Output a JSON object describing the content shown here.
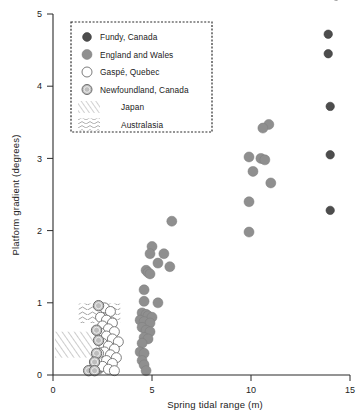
{
  "chart_data": {
    "type": "scatter",
    "title": "",
    "xlabel": "Spring tidal range (m)",
    "ylabel": "Platform gradient (degrees)",
    "xlim": [
      0,
      15
    ],
    "ylim": [
      0,
      5
    ],
    "xticks": [
      0,
      5,
      10,
      15
    ],
    "yticks": [
      0,
      1,
      2,
      3,
      4,
      5
    ],
    "xtick_labels": [
      "0",
      "5",
      "10",
      "15"
    ],
    "ytick_labels": [
      "0",
      "1",
      "2",
      "3",
      "4",
      "5"
    ],
    "grid": false,
    "legend_position": "top-left",
    "series": [
      {
        "name": "Fundy, Canada",
        "marker": "filled-circle",
        "color": "#4d4d4d",
        "points": [
          [
            14.3,
            5.25
          ],
          [
            13.9,
            4.72
          ],
          [
            13.9,
            4.45
          ],
          [
            14.0,
            3.72
          ],
          [
            14.0,
            3.05
          ],
          [
            14.0,
            2.28
          ]
        ]
      },
      {
        "name": "England and Wales",
        "marker": "grey-circle",
        "color": "#8f8f8f",
        "points": [
          [
            10.9,
            3.47
          ],
          [
            10.6,
            3.42
          ],
          [
            9.9,
            3.02
          ],
          [
            10.5,
            3.0
          ],
          [
            10.7,
            2.98
          ],
          [
            10.1,
            2.82
          ],
          [
            11.0,
            2.66
          ],
          [
            9.9,
            2.4
          ],
          [
            9.9,
            1.98
          ],
          [
            6.0,
            2.13
          ],
          [
            5.6,
            1.68
          ],
          [
            5.9,
            1.5
          ],
          [
            5.0,
            1.78
          ],
          [
            4.9,
            1.68
          ],
          [
            5.3,
            1.55
          ],
          [
            4.7,
            1.45
          ],
          [
            4.8,
            1.42
          ],
          [
            4.9,
            1.4
          ],
          [
            4.6,
            1.18
          ],
          [
            4.6,
            1.02
          ],
          [
            5.3,
            1.0
          ],
          [
            4.5,
            0.86
          ],
          [
            4.7,
            0.84
          ],
          [
            4.8,
            0.82
          ],
          [
            5.0,
            0.8
          ],
          [
            4.4,
            0.76
          ],
          [
            4.6,
            0.74
          ],
          [
            4.9,
            0.72
          ],
          [
            4.5,
            0.66
          ],
          [
            4.7,
            0.62
          ],
          [
            4.9,
            0.6
          ],
          [
            4.6,
            0.52
          ],
          [
            4.8,
            0.5
          ],
          [
            4.5,
            0.44
          ],
          [
            4.4,
            0.32
          ],
          [
            4.6,
            0.3
          ],
          [
            4.5,
            0.2
          ],
          [
            4.6,
            0.14
          ],
          [
            4.7,
            0.06
          ],
          [
            2.0,
            0.08
          ],
          [
            2.3,
            0.08
          ]
        ]
      },
      {
        "name": "Gaspé, Quebec",
        "marker": "open-circle",
        "color": "#ffffff",
        "points": [
          [
            2.6,
            0.93
          ],
          [
            2.9,
            0.88
          ],
          [
            2.4,
            0.8
          ],
          [
            2.7,
            0.76
          ],
          [
            3.0,
            0.72
          ],
          [
            2.5,
            0.68
          ],
          [
            2.8,
            0.64
          ],
          [
            3.1,
            0.6
          ],
          [
            2.4,
            0.58
          ],
          [
            2.7,
            0.54
          ],
          [
            3.0,
            0.5
          ],
          [
            3.3,
            0.46
          ],
          [
            2.5,
            0.44
          ],
          [
            2.8,
            0.4
          ],
          [
            3.1,
            0.36
          ],
          [
            2.6,
            0.32
          ],
          [
            2.9,
            0.28
          ],
          [
            3.2,
            0.24
          ],
          [
            2.7,
            0.2
          ],
          [
            3.0,
            0.16
          ],
          [
            2.5,
            0.12
          ],
          [
            2.8,
            0.08
          ],
          [
            3.1,
            0.06
          ],
          [
            2.3,
            0.3
          ]
        ]
      },
      {
        "name": "Newfoundland, Canada",
        "marker": "shaded-circle",
        "color": "#bdbdbd",
        "points": [
          [
            2.3,
            0.96
          ],
          [
            2.2,
            0.62
          ],
          [
            2.3,
            0.48
          ],
          [
            2.2,
            0.3
          ],
          [
            2.1,
            0.18
          ],
          [
            1.8,
            0.06
          ],
          [
            2.1,
            0.06
          ]
        ]
      }
    ],
    "regions": [
      {
        "name": "Japan",
        "pattern": "diagonal-hatch",
        "x0": 0.1,
        "x1": 2.2,
        "y0": 0.24,
        "y1": 0.6
      },
      {
        "name": "Australasia",
        "pattern": "wavy-lines",
        "x0": 1.3,
        "x1": 3.4,
        "y0": 0.72,
        "y1": 0.99
      }
    ]
  },
  "legend": {
    "items": [
      {
        "label": "Fundy, Canada",
        "marker": "filled-circle"
      },
      {
        "label": "England and Wales",
        "marker": "grey-circle"
      },
      {
        "label": "Gaspé, Quebec",
        "marker": "open-circle"
      },
      {
        "label": "Newfoundland, Canada",
        "marker": "shaded-circle"
      },
      {
        "label": "Japan",
        "marker": "diagonal-hatch"
      },
      {
        "label": "Australasia",
        "marker": "wavy-lines"
      }
    ]
  }
}
